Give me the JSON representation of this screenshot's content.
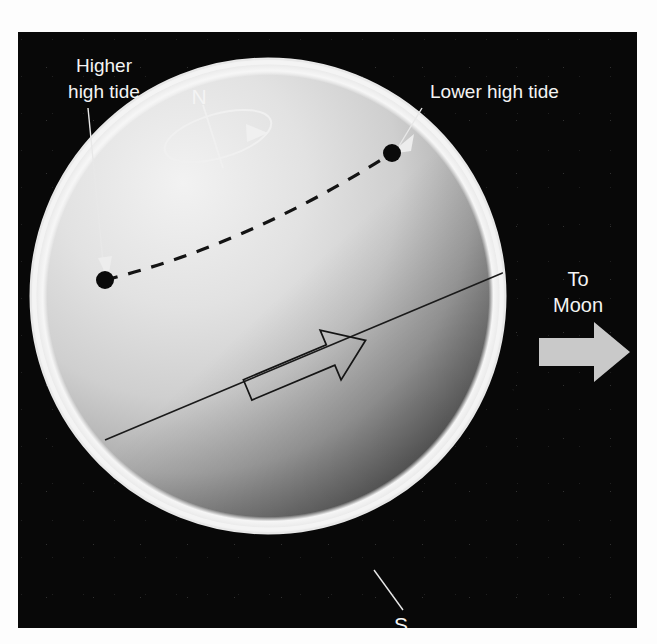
{
  "figure": {
    "kind": "astronomy-diagram",
    "background_color": "#080808",
    "page_color": "#ffffff"
  },
  "labels": {
    "higher_high_tide_line1": "Higher",
    "higher_high_tide_line2": "high tide",
    "lower_high_tide": "Lower high tide",
    "north_pole": "N",
    "south_pole": "S",
    "to_moon_line1": "To",
    "to_moon_line2": "Moon"
  },
  "globe": {
    "name": "earth",
    "center_x": 268,
    "center_y": 296,
    "radius": 238,
    "rim_color": "#f2f2f2",
    "lit_color": "#e9e9e9",
    "shadow_color": "#3a3a3a"
  },
  "markers": [
    {
      "name": "higher-high-tide-dot",
      "x": 87,
      "y": 248,
      "r": 9
    },
    {
      "name": "lower-high-tide-dot",
      "x": 374,
      "y": 121,
      "r": 9
    }
  ],
  "features": {
    "tidal_axis_label": "Tidal bulge axis toward Moon",
    "dashed_line_label": "Parallel of latitude",
    "rotation_label": "Earth rotation direction",
    "moon_arrow_color": "#c9c9c9",
    "moon_arrow_direction": "right"
  },
  "colors": {
    "space": "#080808",
    "label_text": "#f4f4f4",
    "leader_line": "#e8e8e8",
    "ink_line": "#1a1a1a",
    "moon_arrow": "#c9c9c9"
  }
}
